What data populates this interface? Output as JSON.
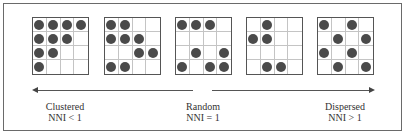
{
  "diagram": {
    "grids": [
      {
        "name": "clustered-pattern",
        "dots": [
          [
            1,
            1
          ],
          [
            1,
            2
          ],
          [
            1,
            3
          ],
          [
            1,
            4
          ],
          [
            2,
            1
          ],
          [
            2,
            2
          ],
          [
            2,
            3
          ],
          [
            3,
            1
          ],
          [
            3,
            2
          ],
          [
            4,
            1
          ]
        ]
      },
      {
        "name": "semi-clustered-pattern",
        "dots": [
          [
            1,
            1
          ],
          [
            1,
            2
          ],
          [
            2,
            1
          ],
          [
            2,
            2
          ],
          [
            2,
            3
          ],
          [
            3,
            3
          ],
          [
            3,
            4
          ],
          [
            4,
            1
          ],
          [
            4,
            2
          ]
        ]
      },
      {
        "name": "random-pattern",
        "dots": [
          [
            1,
            1
          ],
          [
            1,
            2
          ],
          [
            1,
            3
          ],
          [
            3,
            2
          ],
          [
            3,
            4
          ],
          [
            4,
            1
          ],
          [
            4,
            3
          ],
          [
            4,
            4
          ]
        ]
      },
      {
        "name": "semi-dispersed-pattern",
        "dots": [
          [
            1,
            2
          ],
          [
            2,
            1
          ],
          [
            2,
            2
          ],
          [
            4,
            2
          ],
          [
            4,
            3
          ]
        ]
      },
      {
        "name": "dispersed-pattern",
        "dots": [
          [
            1,
            1
          ],
          [
            1,
            3
          ],
          [
            2,
            2
          ],
          [
            2,
            4
          ],
          [
            3,
            1
          ],
          [
            3,
            3
          ],
          [
            4,
            2
          ],
          [
            4,
            4
          ]
        ]
      }
    ],
    "labels": {
      "clustered": {
        "title": "Clustered",
        "formula": "NNI < 1"
      },
      "random": {
        "title": "Random",
        "formula": "NNI = 1"
      },
      "dispersed": {
        "title": "Dispersed",
        "formula": "NNI > 1"
      }
    },
    "colors": {
      "dot": "#4a4a4a",
      "grid_border": "#555555",
      "grid_line": "#c4c4c4",
      "frame": "#6a6a6a"
    }
  }
}
